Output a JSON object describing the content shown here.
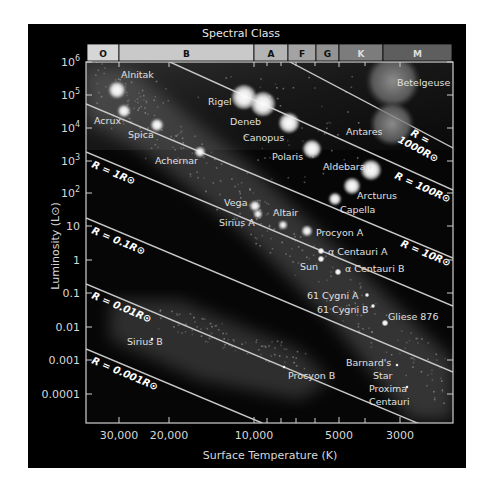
{
  "chart_data": {
    "type": "scatter",
    "title": "Spectral Class",
    "xlabel": "Surface Temperature (K)",
    "ylabel": "Luminosity (L⊙)",
    "x_scale": "log, reversed",
    "y_scale": "log",
    "xlim": [
      40000,
      2200
    ],
    "ylim": [
      3e-05,
      1000000
    ],
    "x_ticks": [
      "30,000",
      "20,000",
      "10,000",
      "5000",
      "3000"
    ],
    "y_ticks": [
      "10⁶",
      "10⁵",
      "10⁴",
      "10³",
      "10²",
      "10",
      "1",
      "0.1",
      "0.01",
      "0.001",
      "0.0001"
    ],
    "spectral_classes": [
      "O",
      "B",
      "A",
      "F",
      "G",
      "K",
      "M"
    ],
    "radius_lines": [
      "R = 1000R⊙",
      "R = 100R⊙",
      "R = 10R⊙",
      "R = 1R⊙",
      "R = 0.1R⊙",
      "R = 0.01R⊙",
      "R = 0.001R⊙"
    ],
    "grid": false,
    "stars": [
      {
        "name": "Alnitak",
        "temp_K": 30000,
        "luminosity": 100000
      },
      {
        "name": "Acrux",
        "temp_K": 28000,
        "luminosity": 25000
      },
      {
        "name": "Spica",
        "temp_K": 22000,
        "luminosity": 13000
      },
      {
        "name": "Achernar",
        "temp_K": 15000,
        "luminosity": 2000
      },
      {
        "name": "Rigel",
        "temp_K": 11000,
        "luminosity": 100000
      },
      {
        "name": "Deneb",
        "temp_K": 9500,
        "luminosity": 60000
      },
      {
        "name": "Canopus",
        "temp_K": 7500,
        "luminosity": 15000
      },
      {
        "name": "Polaris",
        "temp_K": 6000,
        "luminosity": 2500
      },
      {
        "name": "Betelgeuse",
        "temp_K": 3500,
        "luminosity": 100000
      },
      {
        "name": "Antares",
        "temp_K": 3500,
        "luminosity": 12000
      },
      {
        "name": "Aldebaran",
        "temp_K": 4000,
        "luminosity": 500
      },
      {
        "name": "Arcturus",
        "temp_K": 4300,
        "luminosity": 170
      },
      {
        "name": "Capella",
        "temp_K": 5000,
        "luminosity": 70
      },
      {
        "name": "Vega",
        "temp_K": 9600,
        "luminosity": 40
      },
      {
        "name": "Sirius A",
        "temp_K": 9900,
        "luminosity": 25
      },
      {
        "name": "Altair",
        "temp_K": 7700,
        "luminosity": 11
      },
      {
        "name": "Procyon A",
        "temp_K": 6500,
        "luminosity": 7
      },
      {
        "name": "α Centauri A",
        "temp_K": 5800,
        "luminosity": 1.5
      },
      {
        "name": "Sun",
        "temp_K": 5800,
        "luminosity": 1
      },
      {
        "name": "α Centauri B",
        "temp_K": 5200,
        "luminosity": 0.5
      },
      {
        "name": "61 Cygni A",
        "temp_K": 4400,
        "luminosity": 0.15
      },
      {
        "name": "61 Cygni B",
        "temp_K": 4100,
        "luminosity": 0.08
      },
      {
        "name": "Gliese 876",
        "temp_K": 3500,
        "luminosity": 0.013
      },
      {
        "name": "Sirius B",
        "temp_K": 25000,
        "luminosity": 0.03
      },
      {
        "name": "Procyon B",
        "temp_K": 7700,
        "luminosity": 0.0006
      },
      {
        "name": "Barnard's Star",
        "temp_K": 3100,
        "luminosity": 0.0035
      },
      {
        "name": "Proxima Centauri",
        "temp_K": 3000,
        "luminosity": 0.0015
      }
    ]
  },
  "labels": {
    "title": "Spectral Class",
    "xlabel": "Surface Temperature (K)",
    "ylabel": "Luminosity (L⊙)"
  },
  "spectral_bar": [
    {
      "cls": "O",
      "x0": 87,
      "x1": 119,
      "fill": "#d6d6d6",
      "text": "#111"
    },
    {
      "cls": "B",
      "x0": 119,
      "x1": 254,
      "fill": "#c9c9c9",
      "text": "#111"
    },
    {
      "cls": "A",
      "x0": 254,
      "x1": 288,
      "fill": "#b4b4b4",
      "text": "#111"
    },
    {
      "cls": "F",
      "x0": 288,
      "x1": 316,
      "fill": "#a3a3a3",
      "text": "#111"
    },
    {
      "cls": "G",
      "x0": 316,
      "x1": 339,
      "fill": "#939393",
      "text": "#111"
    },
    {
      "cls": "K",
      "x0": 339,
      "x1": 383,
      "fill": "#7c7c7c",
      "text": "#ddd"
    },
    {
      "cls": "M",
      "x0": 383,
      "x1": 452,
      "fill": "#5e5e5e",
      "text": "#ddd"
    }
  ],
  "y_axis": [
    {
      "label": "10",
      "sup": "6",
      "y": 62
    },
    {
      "label": "10",
      "sup": "5",
      "y": 95
    },
    {
      "label": "10",
      "sup": "4",
      "y": 128
    },
    {
      "label": "10",
      "sup": "3",
      "y": 161
    },
    {
      "label": "10",
      "sup": "2",
      "y": 193
    },
    {
      "label": "10",
      "sup": "",
      "y": 226
    },
    {
      "label": "1",
      "sup": "",
      "y": 260
    },
    {
      "label": "0.1",
      "sup": "",
      "y": 293
    },
    {
      "label": "0.01",
      "sup": "",
      "y": 327
    },
    {
      "label": "0.001",
      "sup": "",
      "y": 360
    },
    {
      "label": "0.0001",
      "sup": "",
      "y": 394
    }
  ],
  "x_axis": [
    {
      "label": "30,000",
      "x": 119
    },
    {
      "label": "20,000",
      "x": 169
    },
    {
      "label": "10,000",
      "x": 254
    },
    {
      "label": "5000",
      "x": 339
    },
    {
      "label": "3000",
      "x": 400
    }
  ],
  "x_minor_ticks": [
    267,
    281,
    296,
    315,
    365
  ],
  "radius_lines": [
    {
      "label": "R = 1000R⊙",
      "x1": 290,
      "y1": 62,
      "x2": 453,
      "y2": 148,
      "lx": 402,
      "ly": 133,
      "two_line": true
    },
    {
      "label": "R = 100R⊙",
      "x1": 170,
      "y1": 62,
      "x2": 453,
      "y2": 190,
      "lx": 394,
      "ly": 178,
      "two_line": false
    },
    {
      "label": "R = 10R⊙",
      "x1": 86,
      "y1": 104,
      "x2": 453,
      "y2": 258,
      "lx": 400,
      "ly": 246,
      "two_line": false
    },
    {
      "label": "R = 1R⊙",
      "x1": 86,
      "y1": 152,
      "x2": 453,
      "y2": 306,
      "lx": 91,
      "ly": 167,
      "two_line": false
    },
    {
      "label": "R = 0.1R⊙",
      "x1": 86,
      "y1": 218,
      "x2": 453,
      "y2": 372,
      "lx": 91,
      "ly": 233,
      "two_line": false
    },
    {
      "label": "R = 0.01R⊙",
      "x1": 86,
      "y1": 284,
      "x2": 453,
      "y2": 438,
      "lx": 91,
      "ly": 298,
      "two_line": false
    },
    {
      "label": "R = 0.001R⊙",
      "x1": 86,
      "y1": 349,
      "x2": 262,
      "y2": 423,
      "lx": 91,
      "ly": 363,
      "two_line": false
    }
  ],
  "stars": [
    {
      "name": "Alnitak",
      "cx": 117,
      "cy": 90,
      "r": 8,
      "lx": 121,
      "ly": 78,
      "anchor": "start"
    },
    {
      "name": "Acrux",
      "cx": 124,
      "cy": 111,
      "r": 6,
      "lx": 94,
      "ly": 124,
      "anchor": "start"
    },
    {
      "name": "Spica",
      "cx": 157,
      "cy": 125,
      "r": 6,
      "lx": 128,
      "ly": 138,
      "anchor": "start"
    },
    {
      "name": "Achernar",
      "cx": 200,
      "cy": 152,
      "r": 5,
      "lx": 155,
      "ly": 164,
      "anchor": "start"
    },
    {
      "name": "Rigel",
      "cx": 244,
      "cy": 97,
      "r": 12,
      "lx": 208,
      "ly": 105,
      "anchor": "start"
    },
    {
      "name": "Deneb",
      "cx": 263,
      "cy": 104,
      "r": 12,
      "lx": 230,
      "ly": 125,
      "anchor": "start"
    },
    {
      "name": "Canopus",
      "cx": 289,
      "cy": 123,
      "r": 10,
      "lx": 243,
      "ly": 141,
      "anchor": "start"
    },
    {
      "name": "Polaris",
      "cx": 312,
      "cy": 149,
      "r": 9,
      "lx": 272,
      "ly": 160,
      "anchor": "start"
    },
    {
      "name": "Betelgeuse",
      "cx": 393,
      "cy": 81,
      "r": 27,
      "lx": 397,
      "ly": 86,
      "anchor": "start"
    },
    {
      "name": "Antares",
      "cx": 392,
      "cy": 124,
      "r": 22,
      "lx": 346,
      "ly": 135,
      "anchor": "start"
    },
    {
      "name": "Aldebaran",
      "cx": 371,
      "cy": 170,
      "r": 10,
      "lx": 323,
      "ly": 170,
      "anchor": "start"
    },
    {
      "name": "Arcturus",
      "cx": 352,
      "cy": 186,
      "r": 8,
      "lx": 357,
      "ly": 199,
      "anchor": "start"
    },
    {
      "name": "Capella",
      "cx": 335,
      "cy": 199,
      "r": 6,
      "lx": 340,
      "ly": 213,
      "anchor": "start"
    },
    {
      "name": "Vega",
      "cx": 255,
      "cy": 206,
      "r": 5,
      "lx": 224,
      "ly": 206,
      "anchor": "start"
    },
    {
      "name": "Sirius A",
      "cx": 258,
      "cy": 214,
      "r": 4,
      "lx": 219,
      "ly": 226,
      "anchor": "start"
    },
    {
      "name": "Altair",
      "cx": 283,
      "cy": 225,
      "r": 4,
      "lx": 273,
      "ly": 216,
      "anchor": "start"
    },
    {
      "name": "Procyon A",
      "cx": 307,
      "cy": 231,
      "r": 5,
      "lx": 316,
      "ly": 236,
      "anchor": "start"
    },
    {
      "name": "α Centauri A",
      "cx": 321,
      "cy": 251,
      "r": 3,
      "lx": 328,
      "ly": 255,
      "anchor": "start"
    },
    {
      "name": "Sun",
      "cx": 321,
      "cy": 259,
      "r": 3,
      "lx": 300,
      "ly": 270,
      "anchor": "start"
    },
    {
      "name": "α Centauri B",
      "cx": 338,
      "cy": 272,
      "r": 3,
      "lx": 345,
      "ly": 272,
      "anchor": "start"
    },
    {
      "name": "61 Cygni A",
      "cx": 367,
      "cy": 295,
      "r": 2,
      "lx": 307,
      "ly": 299,
      "anchor": "start"
    },
    {
      "name": "61 Cygni B",
      "cx": 373,
      "cy": 306,
      "r": 2,
      "lx": 317,
      "ly": 313,
      "anchor": "start"
    },
    {
      "name": "Gliese 876",
      "cx": 385,
      "cy": 323,
      "r": 3,
      "lx": 388,
      "ly": 320,
      "anchor": "start"
    },
    {
      "name": "Sirius B",
      "cx": 152,
      "cy": 339,
      "r": 1.5,
      "lx": 127,
      "ly": 345,
      "anchor": "start"
    },
    {
      "name": "Procyon B",
      "cx": 284,
      "cy": 367,
      "r": 1.5,
      "lx": 288,
      "ly": 379,
      "anchor": "start"
    },
    {
      "name": "Barnard's",
      "cx": 397,
      "cy": 365,
      "r": 1.5,
      "lx": 346,
      "ly": 366,
      "anchor": "start"
    },
    {
      "name": "Star",
      "cx": -10,
      "cy": -10,
      "r": 0,
      "lx": 373,
      "ly": 379,
      "anchor": "start"
    },
    {
      "name": "Proxima",
      "cx": 407,
      "cy": 387,
      "r": 1.5,
      "lx": 369,
      "ly": 392,
      "anchor": "start"
    },
    {
      "name": "Centauri",
      "cx": -10,
      "cy": -10,
      "r": 0,
      "lx": 369,
      "ly": 405,
      "anchor": "start"
    }
  ]
}
